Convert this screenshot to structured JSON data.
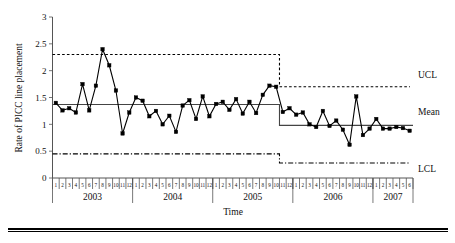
{
  "chart_data": {
    "type": "line",
    "title": "",
    "xlabel": "Time",
    "ylabel": "Rate of PICC line placement",
    "ylim": [
      0,
      3
    ],
    "ytick_labels": [
      "0",
      "0.5",
      "1",
      "1.5",
      "2",
      "2.5",
      "3"
    ],
    "ytick_values": [
      0,
      0.5,
      1,
      1.5,
      2,
      2.5,
      3
    ],
    "grid": false,
    "legend_position": "right",
    "legend": [
      "UCL",
      "Mean",
      "LCL"
    ],
    "years": [
      {
        "label": "2003",
        "months": [
          "1",
          "2",
          "3",
          "4",
          "5",
          "6",
          "7",
          "8",
          "9",
          "10",
          "11",
          "12"
        ]
      },
      {
        "label": "2004",
        "months": [
          "1",
          "2",
          "3",
          "4",
          "5",
          "6",
          "7",
          "8",
          "9",
          "10",
          "11",
          "12"
        ]
      },
      {
        "label": "2005",
        "months": [
          "1",
          "2",
          "3",
          "4",
          "5",
          "6",
          "7",
          "8",
          "9",
          "10",
          "11",
          "12"
        ]
      },
      {
        "label": "2006",
        "months": [
          "1",
          "2",
          "3",
          "4",
          "5",
          "6",
          "7",
          "8",
          "9",
          "10",
          "11",
          "12"
        ]
      },
      {
        "label": "2007",
        "months": [
          "1",
          "2",
          "3",
          "4",
          "5",
          "6"
        ]
      }
    ],
    "categories": [
      "2003-1",
      "2003-2",
      "2003-3",
      "2003-4",
      "2003-5",
      "2003-6",
      "2003-7",
      "2003-8",
      "2003-9",
      "2003-10",
      "2003-11",
      "2003-12",
      "2004-1",
      "2004-2",
      "2004-3",
      "2004-4",
      "2004-5",
      "2004-6",
      "2004-7",
      "2004-8",
      "2004-9",
      "2004-10",
      "2004-11",
      "2004-12",
      "2005-1",
      "2005-2",
      "2005-3",
      "2005-4",
      "2005-5",
      "2005-6",
      "2005-7",
      "2005-8",
      "2005-9",
      "2005-10",
      "2005-11",
      "2005-12",
      "2006-1",
      "2006-2",
      "2006-3",
      "2006-4",
      "2006-5",
      "2006-6",
      "2006-7",
      "2006-8",
      "2006-9",
      "2006-10",
      "2006-11",
      "2006-12",
      "2007-1",
      "2007-2",
      "2007-3",
      "2007-4",
      "2007-5",
      "2007-6"
    ],
    "series": [
      {
        "name": "Rate of PICC line placement",
        "marker": "square",
        "values": [
          1.4,
          1.26,
          1.3,
          1.22,
          1.75,
          1.26,
          1.72,
          2.4,
          2.1,
          1.63,
          0.83,
          1.22,
          1.5,
          1.44,
          1.15,
          1.25,
          1.0,
          1.16,
          0.86,
          1.35,
          1.45,
          1.1,
          1.52,
          1.15,
          1.38,
          1.42,
          1.27,
          1.47,
          1.2,
          1.42,
          1.21,
          1.55,
          1.72,
          1.7,
          1.23,
          1.3,
          1.18,
          1.22,
          1.0,
          0.95,
          1.25,
          0.97,
          1.07,
          0.9,
          0.62,
          1.52,
          0.8,
          0.92,
          1.1,
          0.92,
          0.92,
          0.95,
          0.93,
          0.88
        ]
      }
    ],
    "control_limits": {
      "phase1": {
        "start_index": 0,
        "end_index": 33,
        "ucl": 2.3,
        "mean": 1.37,
        "lcl": 0.45
      },
      "phase2": {
        "start_index": 34,
        "end_index": 53,
        "ucl": 1.7,
        "mean": 0.98,
        "lcl": 0.28
      }
    }
  },
  "labels": {
    "ylabel": "Rate of PICC line placement",
    "xlabel": "Time",
    "ucl": "UCL",
    "mean": "Mean",
    "lcl": "LCL"
  }
}
